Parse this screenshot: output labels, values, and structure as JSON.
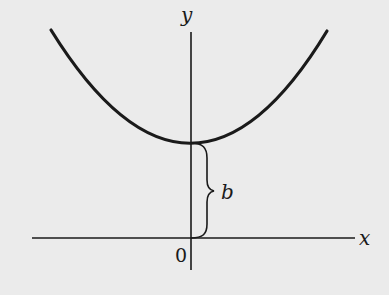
{
  "figure": {
    "type": "parabola-diagram",
    "colors": {
      "background": "#ebebeb",
      "ink": "#1a1a1a"
    },
    "axes": {
      "x_label": "x",
      "y_label": "y",
      "origin_label": "0"
    },
    "curve": {
      "kind": "parabola",
      "vertex_label": "",
      "opens": "up"
    },
    "brace": {
      "label": "b",
      "from": "origin",
      "to": "vertex"
    }
  }
}
